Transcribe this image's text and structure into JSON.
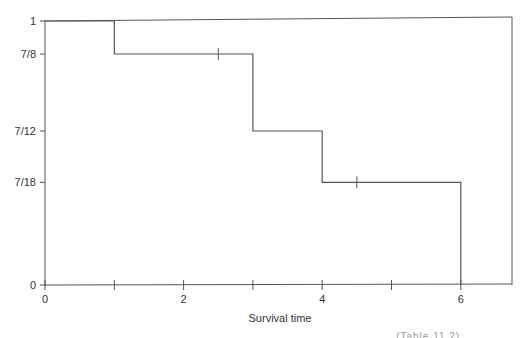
{
  "chart_data": {
    "type": "line",
    "subtype": "kaplan-meier-step",
    "title": "",
    "xlabel": "Survival time",
    "ylabel": "",
    "xlim": [
      0,
      6.8
    ],
    "ylim": [
      0,
      1
    ],
    "x_ticks": [
      {
        "value": 0,
        "label": "0"
      },
      {
        "value": 1,
        "label": ""
      },
      {
        "value": 2,
        "label": "2"
      },
      {
        "value": 3,
        "label": ""
      },
      {
        "value": 4,
        "label": "4"
      },
      {
        "value": 5,
        "label": ""
      },
      {
        "value": 6,
        "label": "6"
      }
    ],
    "y_ticks": [
      {
        "value": 0,
        "label": "0"
      },
      {
        "value": 0.3889,
        "label": "7/18"
      },
      {
        "value": 0.5833,
        "label": "7/12"
      },
      {
        "value": 0.875,
        "label": "7/8"
      },
      {
        "value": 1,
        "label": "1"
      }
    ],
    "grid": false,
    "legend": null,
    "series": [
      {
        "name": "Survival function",
        "steps": [
          {
            "x_start": 0,
            "x_end": 1,
            "y": 1
          },
          {
            "x_start": 1,
            "x_end": 3,
            "y": 0.875,
            "y_label": "7/8"
          },
          {
            "x_start": 3,
            "x_end": 4,
            "y": 0.5833,
            "y_label": "7/12"
          },
          {
            "x_start": 4,
            "x_end": 6,
            "y": 0.3889,
            "y_label": "7/18"
          },
          {
            "x_start": 6,
            "x_end": 6,
            "y": 0
          }
        ],
        "event_times": [
          1,
          3,
          4,
          6
        ],
        "censored_times": [
          2.5,
          4.5
        ]
      }
    ]
  },
  "caption_fragment": "... ... ... ... ... ... ... ... ... ... (Table 11.2)"
}
